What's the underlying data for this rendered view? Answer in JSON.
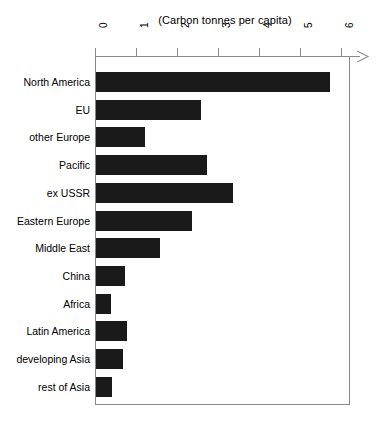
{
  "chart_data": {
    "type": "bar",
    "orientation": "horizontal",
    "title": "(Carbon tonnes per capita)",
    "xlabel": "",
    "ylabel": "",
    "xlim": [
      0,
      6
    ],
    "xticks": [
      0,
      1,
      2,
      3,
      4,
      5,
      6
    ],
    "xtick_labels": [
      "0",
      "1",
      "2",
      "3",
      "4",
      "5",
      "6"
    ],
    "grid": false,
    "legend": null,
    "categories": [
      "North America",
      "EU",
      "other Europe",
      "Pacific",
      "ex USSR",
      "Eastern Europe",
      "Middle East",
      "China",
      "Africa",
      "Latin America",
      "developing Asia",
      "rest of Asia"
    ],
    "values": [
      5.7,
      2.55,
      1.2,
      2.7,
      3.35,
      2.35,
      1.55,
      0.7,
      0.37,
      0.75,
      0.65,
      0.4
    ],
    "bar_color": "#1a1a1a",
    "axis_color": "#8a8a8a"
  },
  "caption": {
    "text": ""
  }
}
